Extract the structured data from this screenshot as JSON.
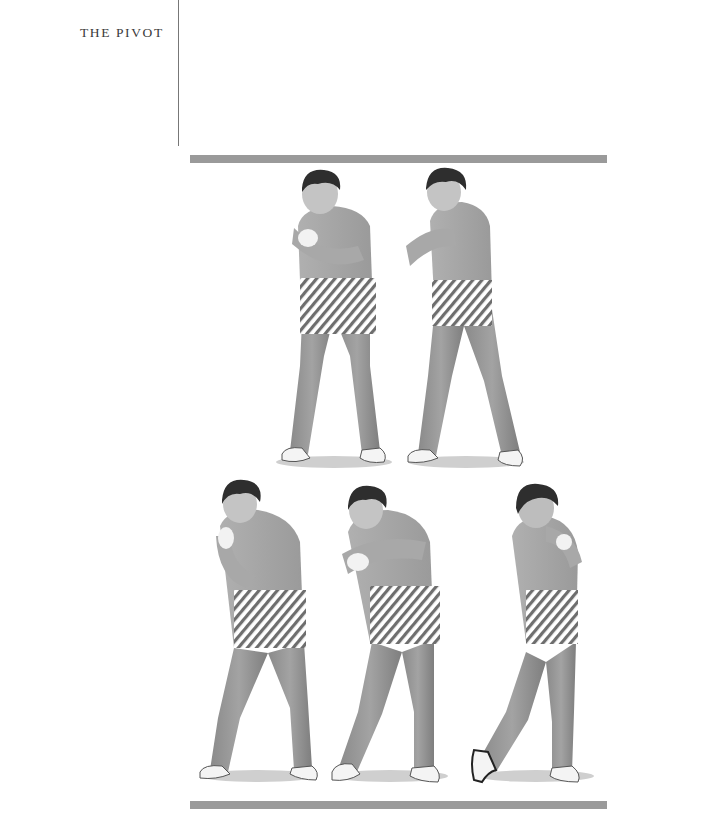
{
  "page": {
    "running_head": "THE PIVOT"
  },
  "illustration": {
    "description": "Sequence of five golfer figures demonstrating the pivot, hip region highlighted with diagonal hatching",
    "rule_color": "#9a9a9a",
    "hatch_color": "#6e6e6e",
    "figures": [
      {
        "label": "pivot-stage-1",
        "row": 1
      },
      {
        "label": "pivot-stage-2",
        "row": 1
      },
      {
        "label": "pivot-stage-3",
        "row": 2
      },
      {
        "label": "pivot-stage-4",
        "row": 2
      },
      {
        "label": "pivot-stage-5",
        "row": 2
      }
    ]
  }
}
